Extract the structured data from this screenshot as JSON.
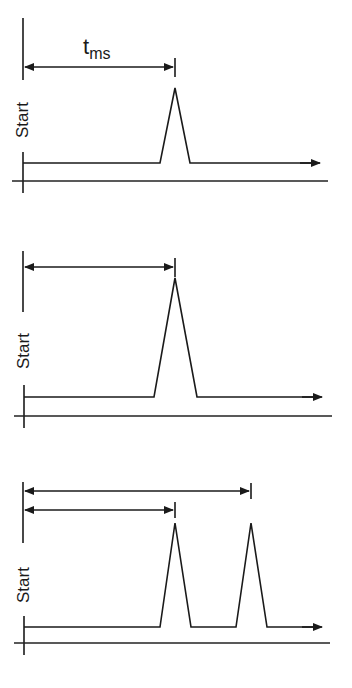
{
  "diagram": {
    "panels": [
      {
        "id": "panel-1",
        "start_label": "Start",
        "time_label": "t",
        "time_label_subscript": "ms",
        "peaks": 1,
        "interval_arrows": 1
      },
      {
        "id": "panel-2",
        "start_label": "Start",
        "peaks": 1,
        "interval_arrows": 1
      },
      {
        "id": "panel-3",
        "start_label": "Start",
        "peaks": 2,
        "interval_arrows": 2
      }
    ]
  }
}
